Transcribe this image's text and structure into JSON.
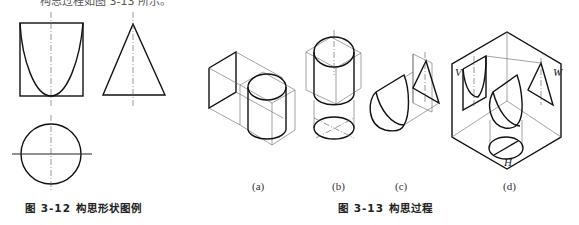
{
  "top_text_cut": "构思过程如图 3-13 所示。",
  "figure_3_12": {
    "caption": "图 3-12   构思形状图例",
    "views": [
      "front-view-parabola-in-square",
      "side-view-triangle",
      "top-view-circle"
    ]
  },
  "figure_3_13": {
    "caption": "图 3-13   构思过程",
    "subfigures": [
      {
        "label": "(a)"
      },
      {
        "label": "(b)"
      },
      {
        "label": "(c)"
      },
      {
        "label": "(d)",
        "plane_labels": {
          "v": "V",
          "w": "W",
          "h": "H"
        }
      }
    ]
  }
}
